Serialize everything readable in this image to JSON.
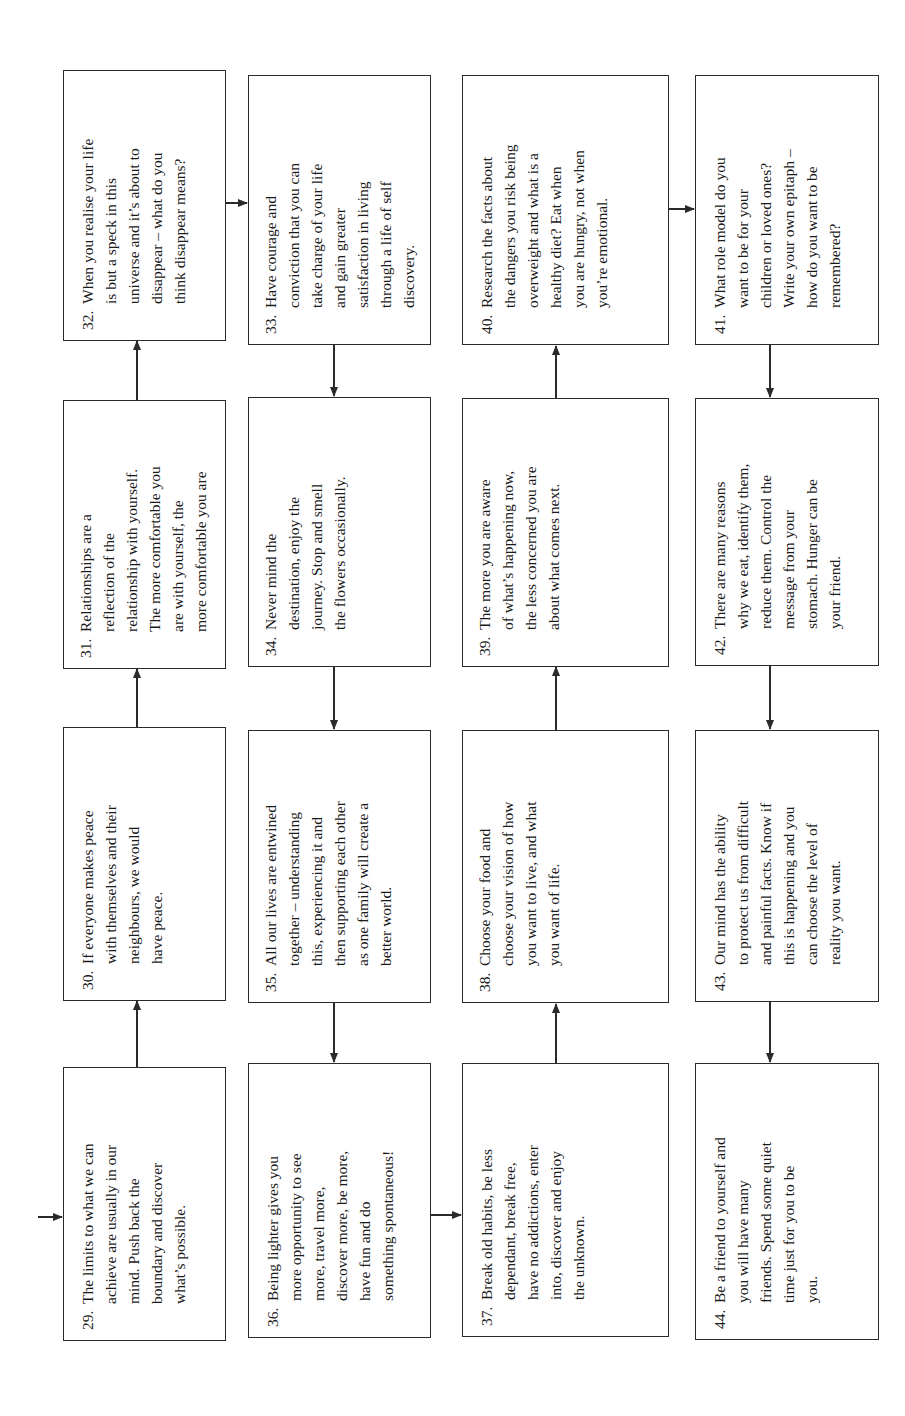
{
  "diagram": {
    "orientation": "rotated-90-ccw",
    "flow_direction": "serpentine",
    "steps": [
      {
        "num": "29.",
        "text": "The limits to what we can\nachieve are usually in our\nmind.  Push back the\nboundary and discover\nwhat’s possible."
      },
      {
        "num": "30.",
        "text": "If everyone makes peace\nwith themselves and their\nneighbours, we would\nhave peace."
      },
      {
        "num": "31.",
        "text": "Relationships are a\nreflection of the\nrelationship with yourself.\nThe more comfortable you\nare with yourself, the\nmore comfortable you are"
      },
      {
        "num": "32.",
        "text": "When you realise your life\nis but a speck in this\nuniverse and it’s about to\ndisappear – what do you\nthink disappear means?"
      },
      {
        "num": "33.",
        "text": "Have courage and\nconviction that you can\ntake charge of your life\nand gain greater\nsatisfaction in living\nthrough a life of self\ndiscovery."
      },
      {
        "num": "34.",
        "text": "Never mind the\ndestination, enjoy the\njourney.  Stop and smell\nthe flowers occasionally."
      },
      {
        "num": "35.",
        "text": "All our lives are entwined\ntogether – understanding\nthis, experiencing it and\nthen supporting each other\nas one family will create a\nbetter world."
      },
      {
        "num": "36.",
        "text": "Being lighter gives you\nmore opportunity to see\nmore, travel more,\ndiscover more, be more,\nhave fun and do\nsomething spontaneous!"
      },
      {
        "num": "37.",
        "text": "Break old habits, be less\ndependant, break free,\nhave no addictions, enter\ninto, discover and enjoy\nthe unknown."
      },
      {
        "num": "38.",
        "text": "Choose your food and\nchoose your vision of how\nyou want to live, and what\nyou want of life."
      },
      {
        "num": "39.",
        "text": "The more you are aware\nof what’s happening now,\nthe less concerned you are\nabout what comes next."
      },
      {
        "num": "40.",
        "text": "Research the facts about\nthe dangers you risk being\noverweight and what is a\nhealthy diet?  Eat when\nyou are hungry, not when\nyou’re emotional."
      },
      {
        "num": "41.",
        "text": "What role model do you\nwant to be for your\nchildren or loved ones?\nWrite your own epitaph –\nhow do you want to be\nremembered?"
      },
      {
        "num": "42.",
        "text": "There are many reasons\nwhy we eat, identify them,\nreduce them.  Control the\nmessage from your\nstomach.  Hunger can be\nyour friend."
      },
      {
        "num": "43.",
        "text": "Our mind has the ability\nto protect us from difficult\nand painful facts.  Know if\nthis is happening and you\ncan choose the level of\nreality you want."
      },
      {
        "num": "44.",
        "text": "Be a friend to yourself and\nyou will have many\nfriends.  Spend some quiet\ntime just for you to be\nyou."
      }
    ]
  },
  "colors": {
    "line": "#2a2a2a",
    "text": "#1a1a1a",
    "background": "#ffffff"
  }
}
